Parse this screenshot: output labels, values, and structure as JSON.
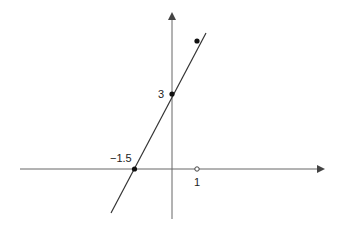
{
  "figure": {
    "type": "linear-function-graph",
    "equation": "y = 2x + 3",
    "colors": {
      "axis": "#555555",
      "line": "#333333",
      "point": "#111111"
    },
    "labels": {
      "y_intercept": "3",
      "x_intercept": "−1.5",
      "unit_x": "1"
    },
    "points": [
      {
        "name": "x-intercept",
        "x": -1.5,
        "y": 0,
        "filled": true
      },
      {
        "name": "y-intercept",
        "x": 0,
        "y": 3,
        "filled": true
      },
      {
        "name": "point-at-1",
        "x": 1,
        "y": 5,
        "filled": true
      },
      {
        "name": "unit-mark",
        "x": 1,
        "y": 0,
        "filled": false
      }
    ]
  }
}
